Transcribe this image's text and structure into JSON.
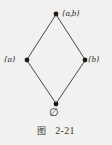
{
  "figure": {
    "type": "hasse-diagram",
    "nodes": [
      {
        "id": "top",
        "label": "{a,b}",
        "x": 56,
        "y": 14
      },
      {
        "id": "left",
        "label": "{a}",
        "x": 27,
        "y": 60
      },
      {
        "id": "right",
        "label": "{b}",
        "x": 85,
        "y": 60
      },
      {
        "id": "bottom",
        "label": "∅",
        "x": 56,
        "y": 104
      }
    ],
    "edges": [
      {
        "from": "left",
        "to": "top"
      },
      {
        "from": "right",
        "to": "top"
      },
      {
        "from": "bottom",
        "to": "left"
      },
      {
        "from": "bottom",
        "to": "right"
      }
    ],
    "colors": {
      "background": "#f2f1ef",
      "line": "#4a4846",
      "node": "#1d1b19",
      "text": "#2c2a28"
    }
  },
  "caption": {
    "label": "图",
    "number": "2-21"
  }
}
